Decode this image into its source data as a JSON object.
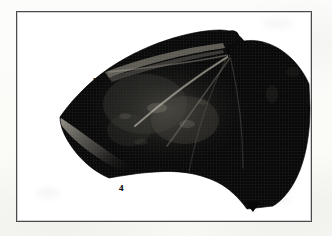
{
  "figure": {
    "kind": "halftone-photographic-plate",
    "frame": {
      "border_color": "#4a4a4a",
      "background_color": "#ffffff"
    },
    "page_background_color": "#fdfdfb",
    "specimen": {
      "fill_color": "#080808",
      "midtone_color": "#2b2b2b",
      "highlight_color": "#9a968c"
    },
    "labels": [
      {
        "id": "1",
        "text": "1",
        "position": "top-center, beside hooked thumb claw"
      },
      {
        "id": "2",
        "text": "2",
        "position": "upper edge of wing membrane"
      },
      {
        "id": "3",
        "text": "3",
        "position": "upper-left leading edge"
      },
      {
        "id": "4",
        "text": "4",
        "position": "lower-left trailing margin"
      },
      {
        "id": "5",
        "text": "5",
        "position": "bottom point of wing tip"
      }
    ],
    "details": {
      "claw_icon": "hook-claw-shape",
      "bone_rays": "diagonal digit rays radiating from upper-right wrist"
    }
  }
}
